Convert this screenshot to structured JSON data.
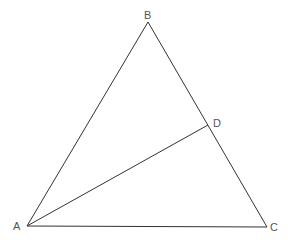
{
  "diagram": {
    "type": "geometry-triangle",
    "points": {
      "A": {
        "label": "A",
        "x": 27,
        "y": 226,
        "lx": 13,
        "ly": 230
      },
      "B": {
        "label": "B",
        "x": 148,
        "y": 22,
        "lx": 144,
        "ly": 19
      },
      "C": {
        "label": "C",
        "x": 267,
        "y": 227,
        "lx": 270,
        "ly": 231
      },
      "D": {
        "label": "D",
        "x": 208,
        "y": 125,
        "lx": 213,
        "ly": 127
      }
    },
    "segments": [
      {
        "from": "A",
        "to": "B"
      },
      {
        "from": "B",
        "to": "C"
      },
      {
        "from": "A",
        "to": "C"
      },
      {
        "from": "A",
        "to": "D"
      }
    ],
    "line_color": "#333333",
    "label_color": "#555555"
  }
}
